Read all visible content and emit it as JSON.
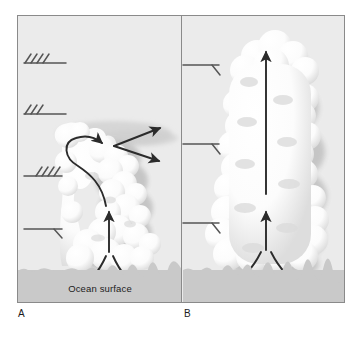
{
  "figure": {
    "background_color": "#ebebeb",
    "border_color": "#8a8a8a",
    "arrow_color": "#2b2b2b",
    "cloud_color": "#ffffff",
    "cloud_shadow_color": "#c4c4c4",
    "ocean_color": "#c9c9c9",
    "text_color": "#1c1c1c"
  },
  "panels": [
    {
      "caption": "A",
      "name": "strong-shear-panel",
      "surface_label": "Ocean surface",
      "wind_barbs": [
        {
          "name": "wind-barb-a-1",
          "barb_count": 4,
          "altitude": "upper"
        },
        {
          "name": "wind-barb-a-2",
          "barb_count": 3,
          "altitude": "upper-middle"
        },
        {
          "name": "wind-barb-a-3",
          "barb_count": 4,
          "altitude": "lower-middle"
        },
        {
          "name": "wind-barb-a-4",
          "barb_count": 1,
          "altitude": "lower"
        }
      ],
      "flow_arrows": [
        {
          "name": "inflow-arrow-left-a"
        },
        {
          "name": "inflow-arrow-right-a"
        },
        {
          "name": "updraft-arrow-a"
        },
        {
          "name": "recirculation-arrow-a"
        },
        {
          "name": "outflow-arrow-upper-a"
        },
        {
          "name": "outflow-arrow-lower-a"
        }
      ]
    },
    {
      "caption": "B",
      "name": "weak-shear-panel",
      "surface_label": "",
      "wind_barbs": [
        {
          "name": "wind-barb-b-1",
          "barb_count": 1,
          "altitude": "upper"
        },
        {
          "name": "wind-barb-b-2",
          "barb_count": 1,
          "altitude": "middle"
        },
        {
          "name": "wind-barb-b-3",
          "barb_count": 1,
          "altitude": "lower"
        }
      ],
      "flow_arrows": [
        {
          "name": "inflow-arrow-left-b"
        },
        {
          "name": "inflow-arrow-right-b"
        },
        {
          "name": "updraft-arrow-lower-b"
        },
        {
          "name": "updraft-arrow-main-b"
        }
      ]
    }
  ]
}
